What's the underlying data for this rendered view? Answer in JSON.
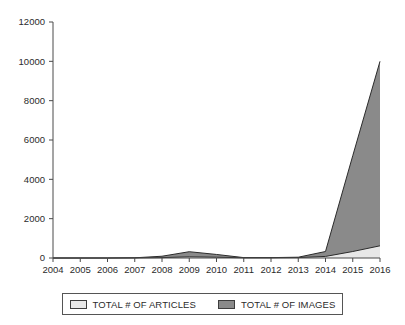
{
  "chart_data": {
    "type": "area",
    "title": "",
    "subtitle": "",
    "xlabel": "",
    "ylabel": "",
    "categories": [
      "2004",
      "2005",
      "2006",
      "2007",
      "2008",
      "2009",
      "2010",
      "2011",
      "2012",
      "2013",
      "2014",
      "2015",
      "2016"
    ],
    "series": [
      {
        "name": "TOTAL # OF ARTICLES",
        "color": "#e8e8e8",
        "values": [
          0,
          0,
          0,
          5,
          20,
          60,
          40,
          10,
          10,
          20,
          80,
          330,
          620
        ]
      },
      {
        "name": "TOTAL # OF IMAGES",
        "color": "#8a8a8a",
        "values": [
          0,
          0,
          0,
          10,
          90,
          320,
          180,
          20,
          20,
          40,
          330,
          5200,
          10000
        ]
      }
    ],
    "ylim": [
      0,
      12000
    ],
    "yticks": [
      0,
      2000,
      4000,
      6000,
      8000,
      10000,
      12000
    ],
    "ytick_labels": [
      "0",
      "2000",
      "4000",
      "6000",
      "8000",
      "10000",
      "12000"
    ],
    "xticks": [
      "2004",
      "2005",
      "2006",
      "2007",
      "2008",
      "2009",
      "2010",
      "2011",
      "2012",
      "2013",
      "2014",
      "2015",
      "2016"
    ],
    "grid": false,
    "legend_position": "bottom",
    "axis_color": "#4a4a4a"
  },
  "legend": {
    "entries": [
      {
        "label": "TOTAL # OF ARTICLES",
        "swatch_color": "#e8e8e8"
      },
      {
        "label": "TOTAL # OF IMAGES",
        "swatch_color": "#8a8a8a"
      }
    ]
  }
}
